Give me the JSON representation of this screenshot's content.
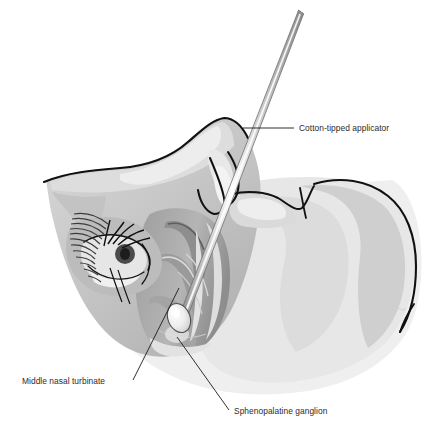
{
  "figure": {
    "background_color": "#ffffff",
    "width": 439,
    "height": 436
  },
  "palette": {
    "outline": "#111111",
    "label_text": "#2b2b2b",
    "skin_lightest": "#f2f2f2",
    "skin_light": "#e4e4e4",
    "skin_mid": "#cfcfcf",
    "skin_medium": "#bcbcbc",
    "skin_dark": "#a6a6a6",
    "skin_darker": "#949494",
    "cavity_shadow": "#8c8c8c",
    "applicator_shaft": "#b9b9b9",
    "applicator_highlight": "#f6f6f6",
    "cotton_tip": "#f0f0f0",
    "hair_black": "#101010"
  },
  "labels": [
    {
      "id": "cotton-tipped-applicator",
      "text": "Cotton-tipped applicator",
      "text_x": 299,
      "text_y": 130,
      "anchor": "start",
      "leader": "M 243 128 L 294 128"
    },
    {
      "id": "middle-nasal-turbinate",
      "text": "Middle nasal turbinate",
      "text_x": 22,
      "text_y": 384,
      "anchor": "start",
      "leader": "M 179 288 L 133 380"
    },
    {
      "id": "sphenopalatine-ganglion",
      "text": "Sphenopalatine ganglion",
      "text_x": 234,
      "text_y": 414,
      "anchor": "start",
      "leader": "M 177 337 L 229 410"
    }
  ],
  "applicator": {
    "name": "cotton-tipped-applicator",
    "shaft_top_x": 301,
    "shaft_top_y": 12,
    "shaft_tip_x": 184,
    "shaft_tip_y": 312,
    "shaft_width": 6,
    "tip_center_x": 179,
    "tip_center_y": 318,
    "tip_rx": 11,
    "tip_ry": 15,
    "tip_rotation": -22
  },
  "anatomy": {
    "regions": [
      "forehead",
      "nasal-bridge",
      "orbit-and-eye",
      "eyebrow",
      "nasal-cavity",
      "middle-turbinate",
      "inferior-turbinate",
      "nostril",
      "upper-lip",
      "cheek",
      "jaw",
      "neck"
    ]
  }
}
